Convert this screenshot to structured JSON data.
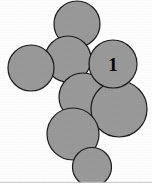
{
  "figure": {
    "canvas": {
      "width": 152,
      "height": 183
    },
    "style": {
      "background_color": "#ffffff",
      "circle_fill": "#9a9a9a",
      "circle_stroke": "#1a1a1a",
      "circle_stroke_width": 1.2,
      "label_color": "#000000",
      "border_color": "#c9c9c9"
    },
    "border": {
      "visible": true,
      "edges": [
        "bottom"
      ]
    }
  },
  "chart_data": {
    "type": "scatter",
    "xlabel": "",
    "ylabel": "",
    "xlim": [
      0,
      152
    ],
    "ylim": [
      0,
      183
    ],
    "grid": false,
    "legend": "none",
    "units": "pixels",
    "note": "Each datum is a circle defined by centre (cx, cy) and radius r in image pixel coordinates, origin top-left.",
    "circles": [
      {
        "id": "circle-top",
        "cx": 77,
        "cy": 24,
        "r": 23,
        "label": "",
        "z": 1
      },
      {
        "id": "circle-upper-mid",
        "cx": 68,
        "cy": 59,
        "r": 23,
        "label": "",
        "z": 2
      },
      {
        "id": "circle-left",
        "cx": 31,
        "cy": 68,
        "r": 23,
        "label": "",
        "z": 3
      },
      {
        "id": "circle-labelled-one",
        "cx": 113,
        "cy": 64,
        "r": 24,
        "label": "1",
        "z": 6
      },
      {
        "id": "circle-center",
        "cx": 83,
        "cy": 97,
        "r": 24,
        "label": "",
        "z": 4
      },
      {
        "id": "circle-right-lower",
        "cx": 119,
        "cy": 109,
        "r": 28,
        "label": "",
        "z": 5
      },
      {
        "id": "circle-bottom-left",
        "cx": 73,
        "cy": 134,
        "r": 26,
        "label": "",
        "z": 7
      },
      {
        "id": "circle-bottom-small",
        "cx": 92,
        "cy": 167,
        "r": 19.5,
        "label": "",
        "z": 8
      }
    ],
    "labels": [
      {
        "text": "1",
        "x": 113,
        "y": 64,
        "font_size": 19,
        "font_weight": "bold",
        "font_style": "serif"
      }
    ]
  }
}
